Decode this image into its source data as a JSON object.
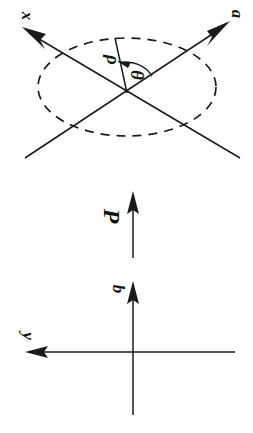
{
  "figure": {
    "background_color": "#ffffff",
    "stroke_color": "#1a1a1a",
    "text_color": "#111111",
    "orientation_note": "page rotated 90 degrees; all labels read sideways",
    "width": 253,
    "height": 433
  },
  "upper_diagram": {
    "name": "rotated-axes-with-ellipse",
    "ellipse": {
      "center_x": 127,
      "center_y": 87,
      "radius_x": 89,
      "radius_y": 49,
      "dashed": true,
      "dash_pattern": "9 7"
    },
    "axes": [
      {
        "label": "x",
        "label_x": 22,
        "label_y": 16,
        "from_x": 240,
        "from_y": 158,
        "to_x": 26,
        "to_y": 30,
        "arrow_at": "to"
      },
      {
        "label": "a",
        "label_x": 232,
        "label_y": 14,
        "from_x": 25,
        "from_y": 158,
        "to_x": 226,
        "to_y": 24,
        "arrow_at": "to"
      }
    ],
    "polar": {
      "rho_label": "ρ",
      "rho_label_x": 107,
      "rho_label_y": 60,
      "rho_line_from_x": 127,
      "rho_line_from_y": 93,
      "rho_line_to_x": 115,
      "rho_line_to_y": 38,
      "theta_label": "θ",
      "theta_label_x": 131,
      "theta_label_y": 75,
      "theta_arc_radius": 30,
      "theta_arc_note": "arc swept from rho line toward the a axis with arrowhead"
    }
  },
  "lower_diagram": {
    "name": "orthogonal-axes-with-polarization",
    "axes": [
      {
        "label": "y",
        "label_x": 23,
        "label_y": 336,
        "from_x": 235,
        "from_y": 352,
        "to_x": 26,
        "to_y": 352,
        "arrow_at": "to",
        "direction": "horizontal-left"
      },
      {
        "label": "b",
        "label_x": 113,
        "label_y": 289,
        "from_x": 133,
        "from_y": 415,
        "to_x": 133,
        "to_y": 283,
        "arrow_at": "to",
        "direction": "vertical-up"
      }
    ],
    "vector": {
      "label": "P",
      "label_x": 104,
      "label_y": 216,
      "from_x": 133,
      "from_y": 258,
      "to_x": 133,
      "to_y": 193,
      "arrow_at": "to",
      "direction": "vertical-up"
    }
  }
}
